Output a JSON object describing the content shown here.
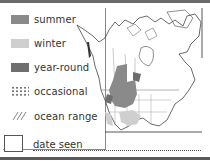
{
  "legend": {
    "items": [
      {
        "label": "summer",
        "type": "swatch",
        "color": "#8a8a8a"
      },
      {
        "label": "winter",
        "type": "swatch",
        "color": "#cfcfcf"
      },
      {
        "label": "year-round",
        "type": "swatch",
        "color": "#6e6e6e"
      },
      {
        "label": "occasional",
        "type": "dots",
        "color": "#777777"
      },
      {
        "label": "ocean range",
        "type": "hatch",
        "color": "#777777"
      }
    ]
  },
  "checklist": {
    "date_label": "date seen"
  },
  "map": {
    "region": "North America",
    "colors": {
      "outline": "#444444",
      "summer": "#8a8a8a",
      "winter": "#cfcfcf",
      "year_round": "#6e6e6e"
    }
  }
}
